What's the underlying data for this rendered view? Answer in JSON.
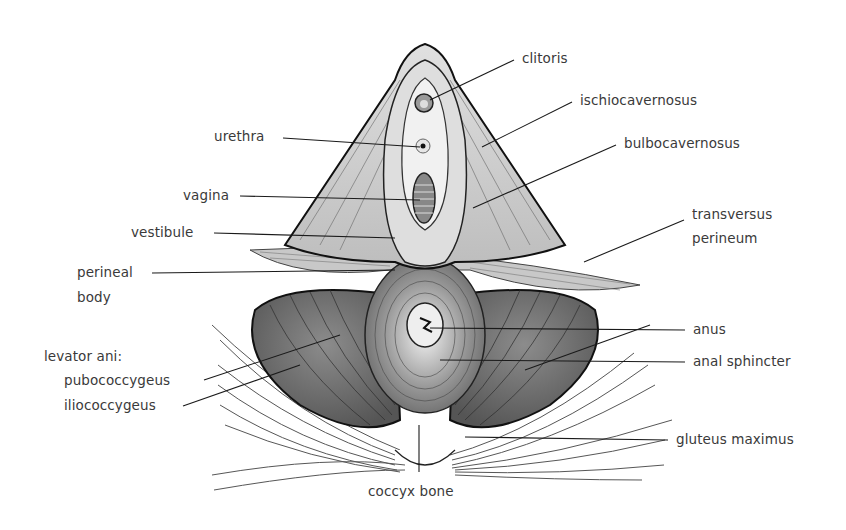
{
  "figure": {
    "labels": {
      "clitoris": "clitoris",
      "ischiocavernosus": "ischiocavernosus",
      "bulbocavernosus": "bulbocavernosus",
      "transversus_line1": "transversus",
      "transversus_line2": "perineum",
      "urethra": "urethra",
      "vagina": "vagina",
      "vestibule": "vestibule",
      "perineal_line1": "perineal",
      "perineal_line2": "body",
      "levator_ani": "levator ani:",
      "pubococcygeus": "pubococcygeus",
      "iliococcygeus": "iliococcygeus",
      "anus": "anus",
      "anal_sphincter": "anal sphincter",
      "gluteus_maximus": "gluteus maximus",
      "coccyx_bone": "coccyx bone"
    },
    "colors": {
      "ink": "#1a1a1a",
      "label_text": "#3a3a3a",
      "muscle_light": "#d9d9d9",
      "muscle_mid": "#a8a8a8",
      "muscle_dark": "#6e6e6e",
      "background": "#ffffff"
    }
  }
}
